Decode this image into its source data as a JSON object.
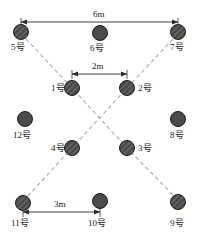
{
  "diagram": {
    "title": "",
    "unit_suffix": "号",
    "colors": {
      "node_fill": "#4a4a4a",
      "node_stroke": "#1a1a1a",
      "hatch_line": "#9a9a9a",
      "dashed_line": "#b0b0b0",
      "dimension_line": "#2b2b2b",
      "text": "#1a1a1a",
      "background": "#ffffff"
    },
    "nodes": [
      {
        "id": "n1",
        "label": "1号",
        "cx": 72,
        "cy": 88,
        "r": 7.5,
        "hatched": true,
        "label_side": "left",
        "label_x": 51,
        "label_y": 84
      },
      {
        "id": "n2",
        "label": "2号",
        "cx": 127,
        "cy": 88,
        "r": 7.5,
        "hatched": true,
        "label_side": "right",
        "label_x": 138,
        "label_y": 84
      },
      {
        "id": "n3",
        "label": "3号",
        "cx": 127,
        "cy": 148,
        "r": 7.5,
        "hatched": true,
        "label_side": "right",
        "label_x": 138,
        "label_y": 144
      },
      {
        "id": "n4",
        "label": "4号",
        "cx": 72,
        "cy": 148,
        "r": 7.5,
        "hatched": true,
        "label_side": "left",
        "label_x": 51,
        "label_y": 144
      },
      {
        "id": "n5",
        "label": "5号",
        "cx": 21,
        "cy": 32,
        "r": 7.5,
        "hatched": true,
        "label_side": "below",
        "label_x": 11,
        "label_y": 43
      },
      {
        "id": "n6",
        "label": "6号",
        "cx": 100,
        "cy": 33,
        "r": 7.5,
        "hatched": false,
        "label_side": "below",
        "label_x": 90,
        "label_y": 44
      },
      {
        "id": "n7",
        "label": "7号",
        "cx": 178,
        "cy": 32,
        "r": 7.5,
        "hatched": true,
        "label_side": "below",
        "label_x": 170,
        "label_y": 43
      },
      {
        "id": "n8",
        "label": "8号",
        "cx": 178,
        "cy": 119,
        "r": 7.5,
        "hatched": false,
        "label_side": "below",
        "label_x": 170,
        "label_y": 131
      },
      {
        "id": "n9",
        "label": "9号",
        "cx": 178,
        "cy": 202,
        "r": 7.5,
        "hatched": true,
        "label_side": "below",
        "label_x": 170,
        "label_y": 219
      },
      {
        "id": "n10",
        "label": "10号",
        "cx": 100,
        "cy": 201,
        "r": 7.5,
        "hatched": false,
        "label_side": "below",
        "label_x": 88,
        "label_y": 219
      },
      {
        "id": "n11",
        "label": "11号",
        "cx": 23,
        "cy": 203,
        "r": 7.5,
        "hatched": true,
        "label_side": "below",
        "label_x": 11,
        "label_y": 219
      },
      {
        "id": "n12",
        "label": "12号",
        "cx": 25,
        "cy": 119,
        "r": 7.5,
        "hatched": false,
        "label_side": "below",
        "label_x": 13,
        "label_y": 131
      }
    ],
    "dashed_connections": [
      {
        "id": "line-5-to-3-9",
        "from": "5号",
        "to": "9号",
        "points": "26,39 72,88 127,148 174,196"
      },
      {
        "id": "line-7-to-4-11",
        "from": "7号",
        "to": "11号",
        "points": "173,39 127,88 72,148 28,196"
      }
    ],
    "dimensions": [
      {
        "id": "dim-top",
        "label": "6m",
        "from_node": "5号",
        "to_node": "7号",
        "y": 22,
        "x1": 21,
        "x2": 178,
        "label_x": 93,
        "label_y": 10
      },
      {
        "id": "dim-middle",
        "label": "2m",
        "from_node": "1号",
        "to_node": "2号",
        "y": 74,
        "x1": 72,
        "x2": 127,
        "label_x": 92,
        "label_y": 62
      },
      {
        "id": "dim-bottom",
        "label": "3m",
        "from_node": "11号",
        "to_node": "10号",
        "y": 212,
        "x1": 23,
        "x2": 100,
        "label_x": 54,
        "label_y": 200
      }
    ]
  }
}
